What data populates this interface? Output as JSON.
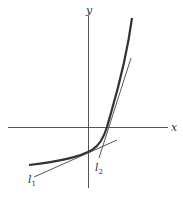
{
  "figure": {
    "axes": {
      "x_label": "x",
      "y_label": "y",
      "origin_px": [
        88,
        127
      ]
    },
    "curve": {
      "description": "exponential-like increasing convex curve",
      "color": "#333333"
    },
    "tangent_lines": [
      {
        "label": "l",
        "subscript": "1",
        "description": "shallow tangent line near y-intercept"
      },
      {
        "label": "l",
        "subscript": "2",
        "description": "steep tangent line at x-intercept"
      }
    ],
    "colors": {
      "axes": "#555555",
      "curve": "#333333",
      "tangent": "#444444",
      "background": "#ffffff"
    }
  }
}
